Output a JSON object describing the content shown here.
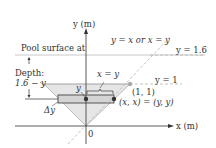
{
  "diagram": {
    "axes": {
      "y_label": "y (m)",
      "x_label": "x (m)",
      "origin_label": "0"
    },
    "labels": {
      "pool_surface": "Pool surface at",
      "depth_title": "Depth:",
      "depth_expr": "1.6 − y",
      "line_diag": "y = x or x = y",
      "line_surface": "y = 1.6",
      "line_top": "y = 1",
      "strip_width": "x = y",
      "y_marker": "y",
      "delta_y": "Δy",
      "point_corner": "(1, 1)",
      "point_strip": "(x, x) = (y, y)"
    },
    "colors": {
      "ink": "#333333",
      "triangle_fill": "#e6e6e6",
      "strip_fill": "#d4d4d4",
      "dashed": "#b5b5b5",
      "surface_line": "#c8c8c8",
      "point_dark": "#333333",
      "point_light": "#aaaaaa"
    }
  }
}
